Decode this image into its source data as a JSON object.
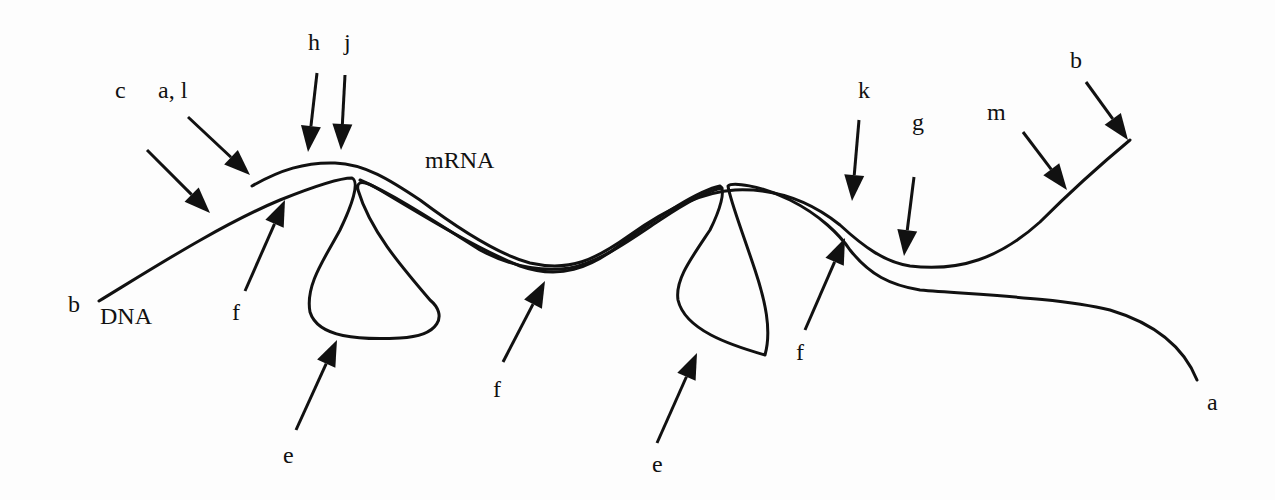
{
  "diagram": {
    "title": "",
    "colors": {
      "ink": "#111111",
      "background": "#fdfdfd"
    },
    "molecule_labels": [
      {
        "id": "dna",
        "text": "DNA",
        "x": 100,
        "y": 315
      },
      {
        "id": "mrna",
        "text": "mRNA",
        "x": 425,
        "y": 160
      }
    ],
    "letter_labels": [
      {
        "id": "c",
        "text": "c",
        "x": 115,
        "y": 98
      },
      {
        "id": "a-l",
        "text": "a, l",
        "x": 158,
        "y": 78
      },
      {
        "id": "h",
        "text": "h",
        "x": 308,
        "y": 30
      },
      {
        "id": "j",
        "text": "j",
        "x": 344,
        "y": 30
      },
      {
        "id": "k",
        "text": "k",
        "x": 860,
        "y": 80
      },
      {
        "id": "g",
        "text": "g",
        "x": 913,
        "y": 115
      },
      {
        "id": "m",
        "text": "m",
        "x": 987,
        "y": 105
      },
      {
        "id": "b-top",
        "text": "b",
        "x": 1070,
        "y": 50
      },
      {
        "id": "b-left",
        "text": "b",
        "x": 68,
        "y": 295
      },
      {
        "id": "f-1",
        "text": "f",
        "x": 232,
        "y": 305
      },
      {
        "id": "f-2",
        "text": "f",
        "x": 493,
        "y": 380
      },
      {
        "id": "f-3",
        "text": "f",
        "x": 796,
        "y": 345
      },
      {
        "id": "e-1",
        "text": "e",
        "x": 283,
        "y": 448
      },
      {
        "id": "e-2",
        "text": "e",
        "x": 652,
        "y": 456
      },
      {
        "id": "a-end",
        "text": "a",
        "x": 1207,
        "y": 392
      }
    ],
    "arrows": [
      {
        "id": "arrow-c",
        "label": "c",
        "x1": 147,
        "y1": 150,
        "x2": 210,
        "y2": 213
      },
      {
        "id": "arrow-a-l",
        "label": "a, l",
        "x1": 188,
        "y1": 117,
        "x2": 250,
        "y2": 175
      },
      {
        "id": "arrow-h",
        "label": "h",
        "x1": 317,
        "y1": 73,
        "x2": 308,
        "y2": 152
      },
      {
        "id": "arrow-j",
        "label": "j",
        "x1": 345,
        "y1": 75,
        "x2": 341,
        "y2": 150
      },
      {
        "id": "arrow-f-1",
        "label": "f",
        "x1": 245,
        "y1": 291,
        "x2": 285,
        "y2": 200
      },
      {
        "id": "arrow-e-1",
        "label": "e",
        "x1": 296,
        "y1": 430,
        "x2": 337,
        "y2": 340
      },
      {
        "id": "arrow-f-2",
        "label": "f",
        "x1": 503,
        "y1": 362,
        "x2": 545,
        "y2": 281
      },
      {
        "id": "arrow-e-2",
        "label": "e",
        "x1": 657,
        "y1": 443,
        "x2": 697,
        "y2": 353
      },
      {
        "id": "arrow-k",
        "label": "k",
        "x1": 859,
        "y1": 120,
        "x2": 852,
        "y2": 201
      },
      {
        "id": "arrow-g",
        "label": "g",
        "x1": 914,
        "y1": 177,
        "x2": 904,
        "y2": 256
      },
      {
        "id": "arrow-f-3",
        "label": "f",
        "x1": 805,
        "y1": 330,
        "x2": 845,
        "y2": 238
      },
      {
        "id": "arrow-m",
        "label": "m",
        "x1": 1023,
        "y1": 132,
        "x2": 1067,
        "y2": 190
      },
      {
        "id": "arrow-b-top",
        "label": "b",
        "x1": 1086,
        "y1": 82,
        "x2": 1128,
        "y2": 140
      }
    ]
  }
}
